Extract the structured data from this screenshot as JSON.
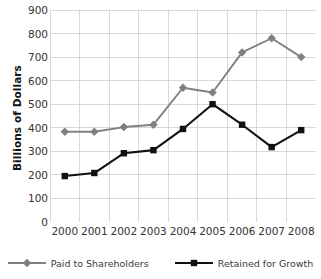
{
  "chart_data": {
    "type": "line",
    "title": "",
    "xlabel": "",
    "ylabel": "Billions of Dollars",
    "categories": [
      "2000",
      "2001",
      "2002",
      "2003",
      "2004",
      "2005",
      "2006",
      "2007",
      "2008"
    ],
    "ylim": [
      0,
      900
    ],
    "ytick_labels": [
      "900",
      "800",
      "700",
      "600",
      "500",
      "400",
      "300",
      "200",
      "100",
      "0"
    ],
    "ytick_values": [
      900,
      800,
      700,
      600,
      500,
      400,
      300,
      200,
      100,
      0
    ],
    "grid": true,
    "legend_position": "bottom",
    "series": [
      {
        "name": "Paid to Shareholders",
        "color": "#808080",
        "marker": "diamond",
        "values": [
          383,
          383,
          403,
          413,
          570,
          550,
          720,
          780,
          700
        ]
      },
      {
        "name": "Retained for Growth",
        "color": "#111111",
        "marker": "square",
        "values": [
          195,
          208,
          292,
          305,
          395,
          500,
          413,
          318,
          390
        ]
      }
    ]
  },
  "axes": {
    "y_title": "Billions of Dollars"
  },
  "colors": {
    "grid": "#cfcfcf",
    "series_paid": "#808080",
    "series_retained": "#111111",
    "text": "#333333"
  }
}
